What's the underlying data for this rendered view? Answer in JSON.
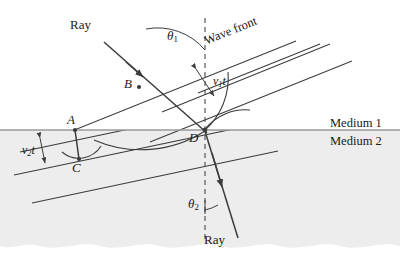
{
  "figure": {
    "kind": "refraction-wavefront-diagram",
    "background": "#ffffff",
    "line_color": "#3c3c3c",
    "medium2_fill": "#ededed",
    "interface_color": "#9a9a9a"
  },
  "labels": {
    "ray_incident": "Ray",
    "ray_refracted": "Ray",
    "wave_front": "Wave front",
    "medium_1": "Medium 1",
    "medium_2": "Medium 2",
    "theta_1": "θ",
    "theta_1_sub": "1",
    "theta_2": "θ",
    "theta_2_sub": "2",
    "v1t": "v",
    "v1t_sub": "1",
    "v1t_t": "t",
    "v2t": "v",
    "v2t_sub": "2",
    "v2t_t": "t",
    "point_a": "A",
    "point_b": "B",
    "point_c": "C",
    "point_d": "D"
  },
  "geometry": {
    "interface_y": 130,
    "point_a": [
      75,
      130
    ],
    "point_b": [
      138,
      86
    ],
    "point_c": [
      78,
      158
    ],
    "point_d": [
      205,
      130
    ],
    "wavefront_angle_medium1_deg": 22,
    "wavefront_angle_medium2_deg": 12,
    "normal_x": 205
  }
}
